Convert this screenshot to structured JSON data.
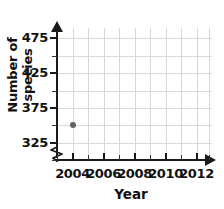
{
  "chart_data": {
    "type": "scatter",
    "title": "",
    "xlabel": "Year",
    "ylabel": "Number of species",
    "xlim": [
      2003,
      2013
    ],
    "ylim": [
      300,
      490
    ],
    "grid": true,
    "legend": null,
    "x_ticklabels": [
      "2004",
      "2006",
      "2008",
      "2010",
      "2012"
    ],
    "x_tickvalues": [
      2004,
      2006,
      2008,
      2010,
      2012
    ],
    "x_minor_tickvalues": [
      2003,
      2005,
      2007,
      2009,
      2011,
      2012.8
    ],
    "y_ticklabels": [
      "325",
      "375",
      "425",
      "475"
    ],
    "y_tickvalues": [
      325,
      375,
      425,
      475
    ],
    "y_minor_tickvalues": [
      300,
      350,
      400,
      450
    ],
    "axis_break_x": false,
    "axis_break_y": true,
    "points": [
      {
        "x": 2004,
        "y": 350,
        "label": ""
      }
    ],
    "series": [
      {
        "name": "Number of species",
        "x": [
          2004
        ],
        "values": [
          350
        ],
        "color": "#616161",
        "marker": "circle"
      }
    ]
  },
  "colors": {
    "background": "#ffffff",
    "axis": "#1a1a1a",
    "grid": "#d9d9d9",
    "point": "#616161",
    "text": "#111111"
  }
}
